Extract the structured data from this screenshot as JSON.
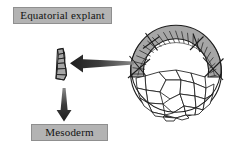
{
  "figure": {
    "title_top": "Equatorial explant",
    "title_bottom": "Mesoderm",
    "background_color": "#ffffff"
  },
  "labels": {
    "equatorial_explant": "Equatorial explant",
    "mesoderm": "Mesoderm"
  },
  "colors": {
    "label_background": "#b3b3b3",
    "label_border": "#8f8f8f",
    "label_text": "#121212",
    "cell_outline": "#1d1d1d",
    "shaded_band_fill": "#a6a6a6",
    "vegetal_cell_fill": "#ffffff",
    "arrow_dark": "#242424",
    "arrow_mid": "#6b6b6b"
  },
  "diagram": {
    "embryo": {
      "name": "amphibian-embryo",
      "outline_shape": "circle",
      "center_x": 176,
      "center_y": 72,
      "radius": 46,
      "shaded_band_label": "equatorial marginal zone",
      "cut_marks_count": 4,
      "small_cells_in_band": 34,
      "large_cells_below": 28
    },
    "explant": {
      "name": "excised-equatorial-explant",
      "center_x": 60,
      "center_y": 64,
      "width": 11,
      "height": 31,
      "cell_count": 6
    },
    "arrows": [
      {
        "name": "arrow-embryo-to-explant",
        "direction": "left",
        "from_x": 133,
        "from_y": 63,
        "to_x": 70,
        "to_y": 63
      },
      {
        "name": "arrow-explant-to-mesoderm",
        "direction": "down",
        "from_x": 64,
        "from_y": 88,
        "to_x": 64,
        "to_y": 121
      }
    ]
  }
}
